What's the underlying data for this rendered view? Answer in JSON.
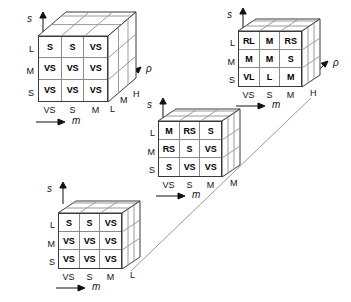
{
  "figure": {
    "type": "fuzzy-rule-base-cube-diagram",
    "axes": {
      "vertical_symbol": "s",
      "horizontal_symbol": "m",
      "depth_symbol": "ρ"
    },
    "row_labels": [
      "L",
      "M",
      "S"
    ],
    "col_labels": [
      "VS",
      "S",
      "M"
    ]
  },
  "cubes": [
    {
      "id": "cube-top-left",
      "depth_labels": [
        "L",
        "M",
        "H"
      ],
      "depth_label_active": "L",
      "vertical_axis": "s",
      "horizontal_axis": "m",
      "depth_axis": "ρ",
      "row_labels": [
        "L",
        "M",
        "S"
      ],
      "col_labels": [
        "VS",
        "S",
        "M"
      ],
      "grid": [
        [
          "S",
          "S",
          "VS"
        ],
        [
          "VS",
          "VS",
          "VS"
        ],
        [
          "VS",
          "VS",
          "VS"
        ]
      ]
    },
    {
      "id": "cube-top-right",
      "depth_labels": [
        "H"
      ],
      "depth_label_active": "H",
      "vertical_axis": "s",
      "horizontal_axis": "m",
      "depth_axis": "ρ",
      "row_labels": [
        "L",
        "M",
        "S"
      ],
      "col_labels": [
        "VS",
        "S",
        "M"
      ],
      "grid": [
        [
          "RL",
          "M",
          "RS"
        ],
        [
          "M",
          "M",
          "S"
        ],
        [
          "VL",
          "L",
          "M"
        ]
      ]
    },
    {
      "id": "cube-middle",
      "depth_labels": [
        "M"
      ],
      "depth_label_active": "M",
      "vertical_axis": "s",
      "horizontal_axis": "m",
      "depth_axis": "",
      "row_labels": [
        "L",
        "M",
        "S"
      ],
      "col_labels": [
        "VS",
        "S",
        "M"
      ],
      "grid": [
        [
          "M",
          "RS",
          "S"
        ],
        [
          "RS",
          "S",
          "VS"
        ],
        [
          "S",
          "VS",
          "VS"
        ]
      ]
    },
    {
      "id": "cube-bottom-left",
      "depth_labels": [
        "L"
      ],
      "depth_label_active": "L",
      "vertical_axis": "s",
      "horizontal_axis": "m",
      "depth_axis": "",
      "row_labels": [
        "L",
        "M",
        "S"
      ],
      "col_labels": [
        "VS",
        "S",
        "M"
      ],
      "grid": [
        [
          "S",
          "S",
          "VS"
        ],
        [
          "VS",
          "VS",
          "VS"
        ],
        [
          "VS",
          "VS",
          "VS"
        ]
      ]
    }
  ],
  "colors": {
    "stroke_dark": "#3a3a3a",
    "stroke_light": "#9a9a9a",
    "text": "#000000",
    "background": "#ffffff"
  }
}
